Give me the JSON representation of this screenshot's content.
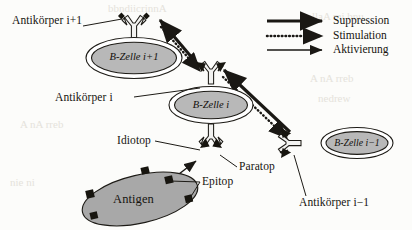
{
  "figure": {
    "name": "idiotypic-network-diagram",
    "language": "de",
    "colors": {
      "ink": "#16140f",
      "cell_fill": "#b8b8b8",
      "antigen_fill": "#a8a8a8",
      "antibody_fill": "#f2f2f0",
      "background": "#fcfcfa",
      "ghost": "#cfcabe"
    }
  },
  "cells": [
    {
      "id": "b-cell-i-plus-1",
      "label": "B-Zelle i+1"
    },
    {
      "id": "b-cell-i",
      "label": "B-Zelle i"
    },
    {
      "id": "b-cell-i-minus-1",
      "label": "B-Zelle i−1"
    }
  ],
  "labels": {
    "antibody_i_plus_1": "Antikörper i+1",
    "antibody_i": "Antikörper i",
    "antibody_i_minus_1": "Antikörper i−1",
    "idiotope": "Idiotop",
    "paratope": "Paratop",
    "epitope": "Epitop",
    "antigen": "Antigen"
  },
  "legend": {
    "items": [
      {
        "id": "suppression",
        "label": "Suppression",
        "style": "solid-thick-arrow"
      },
      {
        "id": "stimulation",
        "label": "Stimulation",
        "style": "dotted-arrow"
      },
      {
        "id": "aktivierung",
        "label": "Aktivierung",
        "style": "solid-thin-arrow"
      }
    ]
  },
  "ghost_text": {
    "line1": "bbndiicrinnA",
    "line2": "I  ollaA  mi  bnu",
    "line3": "A  nA  rreb",
    "line4": "nedrew",
    "line5": "nie  ni"
  }
}
